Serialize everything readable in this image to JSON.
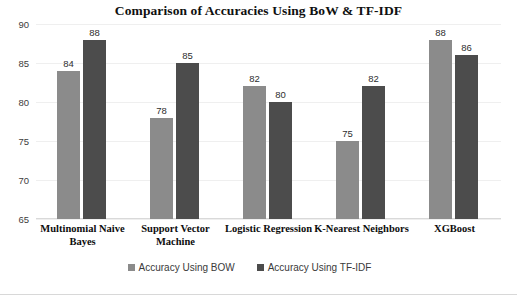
{
  "chart_data": {
    "type": "bar",
    "title": "Comparison of Accuracies Using BoW & TF-IDF",
    "xlabel": "",
    "ylabel": "",
    "ylim": [
      65,
      90
    ],
    "yticks": [
      65,
      70,
      75,
      80,
      85,
      90
    ],
    "grid": true,
    "legend_position": "bottom",
    "categories": [
      "Multinomial Naive Bayes",
      "Support Vector Machine",
      "Logistic Regression",
      "K-Nearest Neighbors",
      "XGBoost"
    ],
    "category_lines": [
      [
        "Multinomial Naive",
        "Bayes"
      ],
      [
        "Support Vector",
        "Machine"
      ],
      [
        "Logistic Regression"
      ],
      [
        "K-Nearest Neighbors"
      ],
      [
        "XGBoost"
      ]
    ],
    "series": [
      {
        "name": "Accuracy Using BOW",
        "color": "#8b8b8b",
        "values": [
          84,
          78,
          82,
          75,
          88
        ]
      },
      {
        "name": "Accuracy Using TF-IDF",
        "color": "#4c4c4c",
        "values": [
          88,
          85,
          80,
          82,
          86
        ]
      }
    ]
  },
  "colors": {
    "series_bow": "#8b8b8b",
    "series_tfidf": "#4c4c4c",
    "gridline": "#efefef",
    "axis": "#d9d9d9",
    "background": "#ffffff",
    "title_text": "#101010"
  }
}
